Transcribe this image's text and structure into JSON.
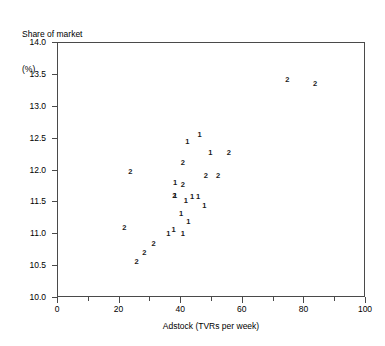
{
  "axes": {
    "ylabel_line1": "Share of market",
    "ylabel_line2": "(%)",
    "xlabel": "Adstock (TVRs per week)"
  },
  "chart_data": {
    "type": "scatter",
    "title": "",
    "subtitle": "",
    "xlabel": "Adstock (TVRs per week)",
    "ylabel": "Share of market (%)",
    "xlim": [
      0,
      100
    ],
    "ylim": [
      10.0,
      14.0
    ],
    "xticks": [
      0,
      20,
      40,
      60,
      80,
      100
    ],
    "xtick_labels": [
      "0",
      "20",
      "40",
      "60",
      "80",
      "100"
    ],
    "xticks_minor": [
      10,
      30,
      50,
      70,
      90
    ],
    "yticks": [
      10.0,
      10.5,
      11.0,
      11.5,
      12.0,
      12.5,
      13.0,
      13.5,
      14.0
    ],
    "ytick_labels": [
      "10.0",
      "10.5",
      "11.0",
      "11.5",
      "12.0",
      "12.5",
      "13.0",
      "13.5",
      "14.0"
    ],
    "grid": false,
    "legend": "none",
    "marker_style": "group-number-glyph",
    "series": [
      {
        "name": "1",
        "marker": "1",
        "points": [
          [
            46.0,
            12.55
          ],
          [
            42.0,
            12.45
          ],
          [
            49.5,
            12.28
          ],
          [
            38.0,
            11.8
          ],
          [
            38.0,
            11.6
          ],
          [
            43.5,
            11.58
          ],
          [
            45.5,
            11.58
          ],
          [
            41.5,
            11.52
          ],
          [
            47.5,
            11.45
          ],
          [
            40.0,
            11.32
          ],
          [
            42.3,
            11.2
          ],
          [
            37.5,
            11.07
          ],
          [
            35.8,
            11.0
          ],
          [
            40.5,
            11.0
          ]
        ]
      },
      {
        "name": "2",
        "marker": "2",
        "points": [
          [
            74.5,
            13.42
          ],
          [
            83.5,
            13.35
          ],
          [
            55.5,
            12.28
          ],
          [
            40.5,
            12.12
          ],
          [
            23.5,
            11.98
          ],
          [
            48.0,
            11.92
          ],
          [
            52.0,
            11.92
          ],
          [
            40.5,
            11.78
          ],
          [
            37.8,
            11.6
          ],
          [
            21.5,
            11.1
          ],
          [
            31.0,
            10.85
          ],
          [
            28.0,
            10.7
          ],
          [
            25.5,
            10.57
          ]
        ]
      }
    ]
  }
}
